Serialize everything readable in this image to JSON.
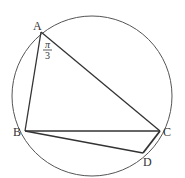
{
  "diagram": {
    "type": "inscribed-quadrilateral-in-circle",
    "circle": {
      "cx": 92,
      "cy": 96,
      "r": 80
    },
    "points": {
      "A": {
        "label": "A",
        "x": 41,
        "y": 32
      },
      "B": {
        "label": "B",
        "x": 25,
        "y": 131
      },
      "C": {
        "label": "C",
        "x": 160,
        "y": 131
      },
      "D": {
        "label": "D",
        "x": 143,
        "y": 153
      }
    },
    "segments": [
      "AB",
      "AC",
      "BC",
      "BD",
      "CD"
    ],
    "angle_A": {
      "numerator": "π",
      "denominator": "3",
      "text": "π/3"
    },
    "colors": {
      "stroke": "#333333",
      "background": "#ffffff"
    }
  }
}
